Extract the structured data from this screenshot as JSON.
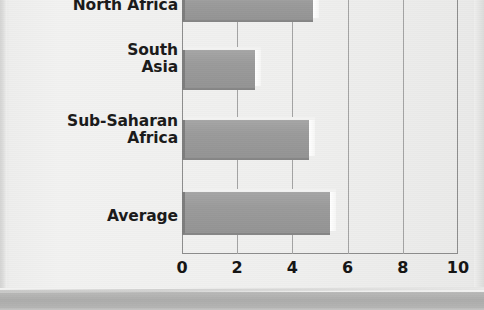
{
  "chart_data": {
    "type": "bar",
    "orientation": "horizontal",
    "title": "",
    "subtitle": "",
    "xlabel": "",
    "ylabel": "",
    "xlim": [
      0,
      10
    ],
    "xticks": [
      0,
      2,
      4,
      6,
      8,
      10
    ],
    "xtick_labels": [
      "0",
      "2",
      "4",
      "6",
      "8",
      "10"
    ],
    "grid": true,
    "grid_axis": "x",
    "legend": false,
    "legend_position": "none",
    "categories": [
      "North Africa",
      "South Asia",
      "Sub-Saharan Africa",
      "Average"
    ],
    "values": [
      4.75,
      2.65,
      4.6,
      5.35
    ],
    "series": [
      {
        "name": "",
        "values": [
          4.75,
          2.65,
          4.6,
          5.35
        ]
      }
    ],
    "note": "top bar (North Africa) is cropped by the image edge"
  },
  "axis": {
    "ticks": [
      {
        "label": "0",
        "value": 0
      },
      {
        "label": "2",
        "value": 2
      },
      {
        "label": "4",
        "value": 4
      },
      {
        "label": "6",
        "value": 6
      },
      {
        "label": "8",
        "value": 8
      },
      {
        "label": "10",
        "value": 10
      }
    ]
  },
  "bars": [
    {
      "label": "North Africa",
      "label_lines": "North Africa",
      "value": 4.75
    },
    {
      "label": "South Asia",
      "label_lines": "South\nAsia",
      "value": 2.65
    },
    {
      "label": "Sub-Saharan Africa",
      "label_lines": "Sub-Saharan\nAfrica",
      "value": 4.6
    },
    {
      "label": "Average",
      "label_lines": "Average",
      "value": 5.35
    }
  ],
  "colors": {
    "page_background": "#efefee",
    "bar_fill": "#9b9b9b",
    "bar_shadow": "#7d7d7d",
    "bar_highlight": "#ffffff",
    "gridline": "#a3a3a3",
    "axis_line": "#8d8d8d",
    "text": "#1a1a1a",
    "footer_band": "#acacab"
  }
}
